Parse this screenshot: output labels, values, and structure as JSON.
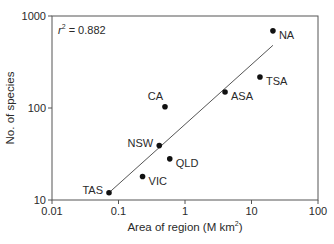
{
  "chart_data": {
    "type": "scatter",
    "title": "",
    "xlabel": "Area of region (M km²)",
    "xlabel_main": "Area of region (M km",
    "xlabel_sup": "2",
    "xlabel_end": ")",
    "ylabel": "No. of species",
    "xscale": "log",
    "yscale": "log",
    "xlim": [
      0.01,
      100
    ],
    "ylim": [
      10,
      1000
    ],
    "x_ticks": [
      {
        "value": 0.01,
        "label": "0.01"
      },
      {
        "value": 0.1,
        "label": "0.1"
      },
      {
        "value": 1,
        "label": "1"
      },
      {
        "value": 10,
        "label": "10"
      },
      {
        "value": 100,
        "label": "100"
      }
    ],
    "y_ticks": [
      {
        "value": 10,
        "label": "10"
      },
      {
        "value": 100,
        "label": "100"
      },
      {
        "value": 1000,
        "label": "1000"
      }
    ],
    "grid": false,
    "annotation": {
      "prefix": "r",
      "sup": "2",
      "text": " = 0.882",
      "full": "r² = 0.882"
    },
    "points": [
      {
        "label": "TAS",
        "x": 0.072,
        "y": 12,
        "label_pos": "left"
      },
      {
        "label": "VIC",
        "x": 0.23,
        "y": 18,
        "label_pos": "right-below"
      },
      {
        "label": "NSW",
        "x": 0.41,
        "y": 39,
        "label_pos": "left"
      },
      {
        "label": "QLD",
        "x": 0.59,
        "y": 28,
        "label_pos": "right-below"
      },
      {
        "label": "CA",
        "x": 0.5,
        "y": 103,
        "label_pos": "above-left"
      },
      {
        "label": "ASA",
        "x": 4.0,
        "y": 149,
        "label_pos": "right-below"
      },
      {
        "label": "TSA",
        "x": 13.4,
        "y": 217,
        "label_pos": "right-below"
      },
      {
        "label": "NA",
        "x": 21,
        "y": 690,
        "label_pos": "right-below"
      }
    ],
    "regression_line": {
      "x_start": 0.072,
      "y_start": 12,
      "x_end": 21,
      "y_end": 480
    }
  },
  "colors": {
    "axis": "#555555",
    "point": "#111111",
    "line": "#555555",
    "text": "#2a2a2a"
  }
}
